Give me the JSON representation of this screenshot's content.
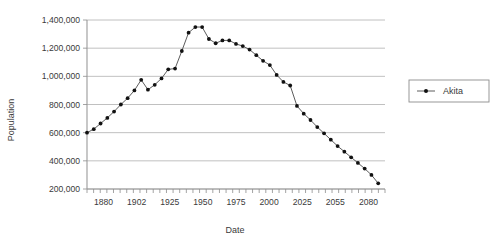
{
  "chart_data": {
    "type": "line",
    "title": "",
    "xlabel": "Date",
    "ylabel": "Population",
    "xlim": [
      1880,
      2100
    ],
    "ylim": [
      200000,
      1400000
    ],
    "grid": true,
    "legend_position": "right",
    "x_tick_labels": [
      "1880",
      "1902",
      "1925",
      "1950",
      "1975",
      "2000",
      "2025",
      "2055",
      "2080"
    ],
    "x_tick_values": [
      1880,
      1902,
      1925,
      1950,
      1975,
      2000,
      2025,
      2055,
      2080
    ],
    "y_tick_labels": [
      "200,000",
      "400,000",
      "600,000",
      "800,000",
      "1,000,000",
      "1,200,000",
      "1,400,000"
    ],
    "y_tick_values": [
      200000,
      400000,
      600000,
      800000,
      1000000,
      1200000,
      1400000
    ],
    "minor_tick_count": 45,
    "series": [
      {
        "name": "Akita",
        "marker": "filled-circle",
        "color": "#111111",
        "x": [
          1880,
          1885,
          1890,
          1895,
          1900,
          1905,
          1910,
          1915,
          1920,
          1925,
          1930,
          1935,
          1940,
          1945,
          1950,
          1955,
          1960,
          1965,
          1970,
          1975,
          1980,
          1985,
          1990,
          1995,
          2000,
          2005,
          2010,
          2015,
          2020,
          2025,
          2030,
          2035,
          2040,
          2045,
          2050,
          2055,
          2060,
          2065,
          2070,
          2075,
          2080,
          2085,
          2090,
          2095
        ],
        "y": [
          600000,
          625000,
          665000,
          705000,
          750000,
          800000,
          845000,
          900000,
          975000,
          905000,
          940000,
          985000,
          1050000,
          1055000,
          1180000,
          1310000,
          1350000,
          1350000,
          1265000,
          1235000,
          1255000,
          1255000,
          1230000,
          1215000,
          1190000,
          1150000,
          1110000,
          1080000,
          1010000,
          960000,
          935000,
          790000,
          735000,
          690000,
          640000,
          595000,
          550000,
          505000,
          465000,
          425000,
          385000,
          345000,
          300000,
          240000
        ]
      }
    ]
  },
  "legend": {
    "entries": [
      {
        "label": "Akita"
      }
    ]
  },
  "axes": {
    "x_title": "Date",
    "y_title": "Population"
  }
}
